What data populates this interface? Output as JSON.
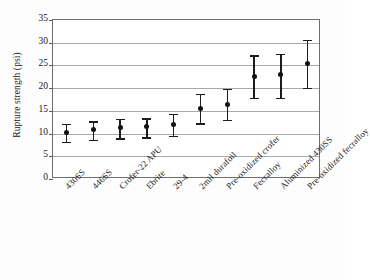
{
  "chart_data": {
    "type": "scatter",
    "title": "",
    "xlabel": "",
    "ylabel": "Rupture strength (psi)",
    "ylim": [
      0,
      35
    ],
    "yticks": [
      0,
      5,
      10,
      15,
      20,
      25,
      30,
      35
    ],
    "grid": true,
    "legend": "none",
    "error_bars": true,
    "categories": [
      "430SS",
      "446SS",
      "Crofer-22 APU",
      "Ebrite",
      "29-4",
      "2mil durafoil",
      "Pre-oxidized crofer",
      "Fecralloy",
      "Aluminized 430SS",
      "Pre-oxidized fecralloy"
    ],
    "values": [
      10.2,
      10.8,
      11.3,
      11.5,
      12.0,
      15.6,
      16.4,
      22.6,
      22.9,
      25.5
    ],
    "error_low": [
      8.2,
      8.6,
      9.0,
      9.2,
      9.5,
      12.3,
      13.0,
      17.9,
      17.9,
      20.1
    ],
    "error_high": [
      12.1,
      12.7,
      13.2,
      13.4,
      14.3,
      18.8,
      19.8,
      27.2,
      27.5,
      30.7
    ],
    "marker": "filled-circle",
    "marker_color": "#111111",
    "errorbar_color": "#1c1c1c",
    "gridline_color": "#a8a8a8",
    "axis_color": "#6f6f6f",
    "background": "#ffffff"
  },
  "axes": {
    "y_title": "Rupture strength (psi)",
    "y_tick_labels": [
      "0",
      "5",
      "10",
      "15",
      "20",
      "25",
      "30",
      "35"
    ]
  }
}
